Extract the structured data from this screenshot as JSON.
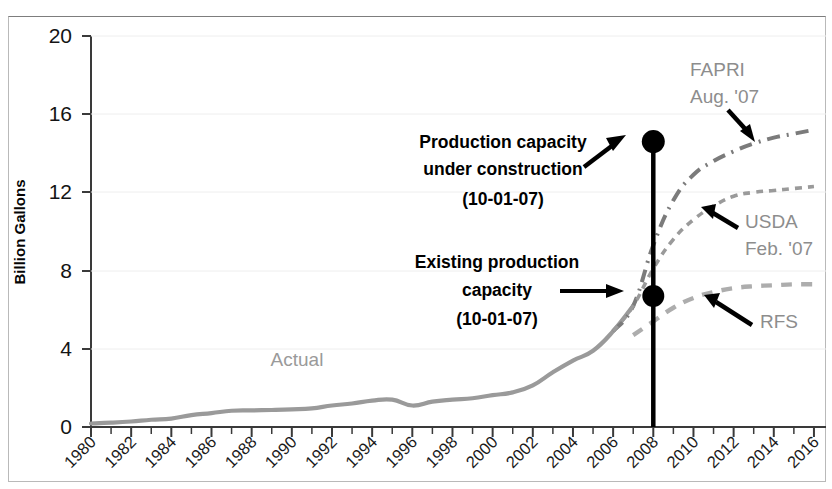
{
  "chart_data": {
    "type": "line",
    "title": "",
    "subtitle": "",
    "xlabel": "",
    "ylabel": "Billion Gallons",
    "xlim": [
      1980,
      2016.6
    ],
    "ylim": [
      0,
      20
    ],
    "yticks": [
      "0",
      "4",
      "8",
      "12",
      "16",
      "20"
    ],
    "ytick_values": [
      0,
      4,
      8,
      12,
      16,
      20
    ],
    "xticks": [
      "1980",
      "1982",
      "1984",
      "1986",
      "1988",
      "1990",
      "1992",
      "1994",
      "1996",
      "1998",
      "2000",
      "2002",
      "2004",
      "2006",
      "2008",
      "2010",
      "2012",
      "2014",
      "2016"
    ],
    "xtick_values": [
      1980,
      1982,
      1984,
      1986,
      1988,
      1990,
      1992,
      1994,
      1996,
      1998,
      2000,
      2002,
      2004,
      2006,
      2008,
      2010,
      2012,
      2014,
      2016
    ],
    "xtick_minor_step": 1,
    "grid": false,
    "legend": "inline-annotations",
    "series": [
      {
        "name": "Actual",
        "style": "solid",
        "color": "#9a9a9a",
        "x": [
          1980,
          1981,
          1982,
          1983,
          1984,
          1985,
          1986,
          1987,
          1988,
          1989,
          1990,
          1991,
          1992,
          1993,
          1994,
          1995,
          1996,
          1997,
          1998,
          1999,
          2000,
          2001,
          2002,
          2003,
          2004,
          2005,
          2006,
          2007
        ],
        "values": [
          0.18,
          0.22,
          0.28,
          0.37,
          0.43,
          0.61,
          0.71,
          0.83,
          0.85,
          0.87,
          0.9,
          0.95,
          1.1,
          1.2,
          1.35,
          1.4,
          1.1,
          1.3,
          1.4,
          1.47,
          1.63,
          1.77,
          2.13,
          2.8,
          3.4,
          3.9,
          4.9,
          6.2
        ]
      },
      {
        "name": "FAPRI Aug. '07",
        "style": "dash-dot",
        "color": "#7b7b7b",
        "x": [
          2006,
          2007,
          2008,
          2009,
          2010,
          2011,
          2012,
          2013,
          2014,
          2015,
          2016
        ],
        "values": [
          4.9,
          6.2,
          9.3,
          11.6,
          12.9,
          13.6,
          14.1,
          14.5,
          14.8,
          15.0,
          15.2
        ]
      },
      {
        "name": "USDA Feb. '07",
        "style": "dotted",
        "color": "#9a9a9a",
        "x": [
          2006,
          2007,
          2008,
          2009,
          2010,
          2011,
          2012,
          2013,
          2014,
          2015,
          2016
        ],
        "values": [
          4.9,
          6.2,
          8.1,
          9.6,
          10.6,
          11.3,
          11.8,
          12.0,
          12.1,
          12.2,
          12.3
        ]
      },
      {
        "name": "RFS",
        "style": "dashed",
        "color": "#adadad",
        "x": [
          2007,
          2008,
          2009,
          2010,
          2011,
          2012,
          2013,
          2014,
          2015,
          2016
        ],
        "values": [
          4.7,
          5.4,
          6.1,
          6.6,
          6.9,
          7.1,
          7.2,
          7.25,
          7.3,
          7.3
        ]
      }
    ],
    "markers": [
      {
        "name": "production-capacity-under-construction",
        "x": 2008,
        "y": 14.6,
        "shape": "filled-circle",
        "color": "#000000"
      },
      {
        "name": "existing-production-capacity",
        "x": 2008,
        "y": 6.7,
        "shape": "filled-circle",
        "color": "#000000"
      }
    ],
    "vertical_line": {
      "x": 2008,
      "y_from": 0,
      "y_to": 14.6,
      "color": "#000000"
    },
    "annotations": [
      {
        "id": "production-capacity",
        "lines": [
          "Production capacity",
          "under construction",
          "(10-01-07)"
        ],
        "color": "#000000",
        "bold": true,
        "arrow": "up-right"
      },
      {
        "id": "existing-capacity",
        "lines": [
          "Existing production",
          "capacity",
          "(10-01-07)"
        ],
        "color": "#000000",
        "bold": true,
        "arrow": "right"
      },
      {
        "id": "fapri",
        "lines": [
          "FAPRI",
          "Aug. '07"
        ],
        "color": "#8d8d8d",
        "bold": false,
        "arrow": "down-right"
      },
      {
        "id": "usda",
        "lines": [
          "USDA",
          "Feb. '07"
        ],
        "color": "#8d8d8d",
        "bold": false,
        "arrow": "up-left"
      },
      {
        "id": "rfs",
        "lines": [
          "RFS"
        ],
        "color": "#8d8d8d",
        "bold": false,
        "arrow": "up-left"
      },
      {
        "id": "actual",
        "lines": [
          "Actual"
        ],
        "color": "#9a9a9a",
        "bold": false,
        "arrow": "none"
      }
    ]
  },
  "axes": {
    "y_title": "Billion Gallons",
    "yticks": [
      "20",
      "16",
      "12",
      "8",
      "4",
      "0"
    ],
    "xticks": [
      "1980",
      "1982",
      "1984",
      "1986",
      "1988",
      "1990",
      "1992",
      "1994",
      "1996",
      "1998",
      "2000",
      "2002",
      "2004",
      "2006",
      "2008",
      "2010",
      "2012",
      "2014",
      "2016"
    ]
  },
  "labels": {
    "prod_cap_l1": "Production capacity",
    "prod_cap_l2": "under construction",
    "prod_cap_l3": "(10-01-07)",
    "exist_cap_l1": "Existing production",
    "exist_cap_l2": "capacity",
    "exist_cap_l3": "(10-01-07)",
    "fapri_l1": "FAPRI",
    "fapri_l2": "Aug. '07",
    "usda_l1": "USDA",
    "usda_l2": "Feb. '07",
    "rfs": "RFS",
    "actual": "Actual"
  }
}
